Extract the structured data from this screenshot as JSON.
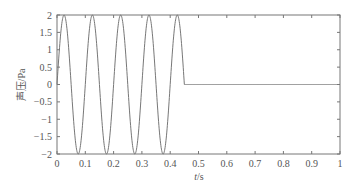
{
  "chart_data": {
    "type": "line",
    "title": "",
    "xlabel": "t/s",
    "ylabel": "声压/Pa",
    "xlim": [
      0,
      1
    ],
    "ylim": [
      -2,
      2
    ],
    "xticks": [
      "0",
      "0.1",
      "0.2",
      "0.3",
      "0.4",
      "0.5",
      "0.6",
      "0.7",
      "0.8",
      "0.9",
      "1"
    ],
    "yticks": [
      "2",
      "1.5",
      "1",
      "0.5",
      "0",
      "−0.5",
      "−1",
      "−1.5",
      "−2"
    ],
    "grid": false,
    "legend": null,
    "series": [
      {
        "name": "sound pressure",
        "description": "Sine burst: amplitude 2 Pa, frequency 10 Hz (period 0.1 s) from t=0 to t≈0.45 s, then 0 Pa until t=1 s",
        "amplitude": 2,
        "frequency_hz": 10,
        "burst_end_s": 0.45,
        "x": [
          0,
          0.025,
          0.05,
          0.075,
          0.1,
          0.125,
          0.15,
          0.175,
          0.2,
          0.225,
          0.25,
          0.275,
          0.3,
          0.325,
          0.35,
          0.375,
          0.4,
          0.425,
          0.45,
          0.5,
          0.6,
          0.7,
          0.8,
          0.9,
          1.0
        ],
        "y": [
          0,
          2,
          0,
          -2,
          0,
          2,
          0,
          -2,
          0,
          2,
          0,
          -2,
          0,
          2,
          0,
          -2,
          0,
          2,
          0,
          0,
          0,
          0,
          0,
          0,
          0
        ]
      }
    ],
    "line_color": "#777777"
  }
}
